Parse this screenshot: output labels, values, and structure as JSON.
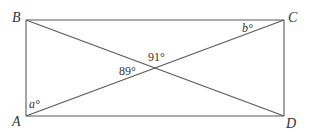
{
  "figure": {
    "type": "rectangle-with-diagonals",
    "vertices": {
      "A": {
        "label": "A",
        "x": 26,
        "y": 116
      },
      "B": {
        "label": "B",
        "x": 26,
        "y": 20
      },
      "C": {
        "label": "C",
        "x": 284,
        "y": 20
      },
      "D": {
        "label": "D",
        "x": 284,
        "y": 116
      }
    },
    "intersection": {
      "x": 155,
      "y": 68
    },
    "angles": {
      "a": {
        "label": "a°",
        "at": "A"
      },
      "b": {
        "label": "b°",
        "at": "C"
      },
      "left": {
        "label": "89°",
        "at": "intersection"
      },
      "top": {
        "label": "91°",
        "at": "intersection"
      }
    },
    "colors": {
      "line": "#5a5a5a",
      "text": "#333333",
      "background": "#ffffff"
    }
  }
}
